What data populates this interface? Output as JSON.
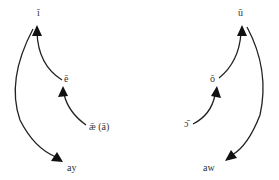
{
  "title": "",
  "colors": {
    "stroke": "#222222",
    "text": "#333333",
    "background": "#ffffff"
  },
  "front_vowels": {
    "nodes": [
      {
        "id": "i_long",
        "label": "ī"
      },
      {
        "id": "e_long",
        "label": "ē"
      },
      {
        "id": "ae_long",
        "label": "ǣ (ā)"
      },
      {
        "id": "ay",
        "label": "ay"
      }
    ],
    "edges": [
      {
        "from": "ae_long",
        "to": "e_long"
      },
      {
        "from": "e_long",
        "to": "i_long"
      },
      {
        "from": "i_long",
        "to": "ay"
      }
    ]
  },
  "back_vowels": {
    "nodes": [
      {
        "id": "u_long",
        "label": "ū"
      },
      {
        "id": "o_long",
        "label": "ō"
      },
      {
        "id": "open_o_long",
        "label": "ɔ̄"
      },
      {
        "id": "aw",
        "label": "aw"
      }
    ],
    "edges": [
      {
        "from": "open_o_long",
        "to": "o_long"
      },
      {
        "from": "o_long",
        "to": "u_long"
      },
      {
        "from": "u_long",
        "to": "aw"
      }
    ]
  }
}
